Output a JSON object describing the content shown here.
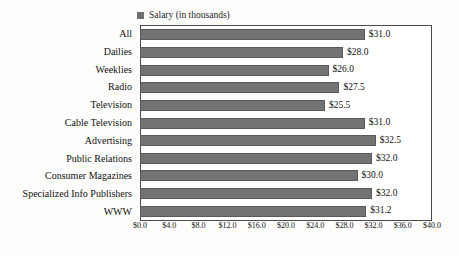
{
  "legend": {
    "marker": "filled-square",
    "label": "Salary (in thousands)",
    "marker_color": "#6f6f6f"
  },
  "axis": {
    "x_ticks": [
      "$0.0",
      "$4.0",
      "$8.0",
      "$12.0",
      "$16.0",
      "$20.0",
      "$24.0",
      "$28.0",
      "$32.0",
      "$36.0",
      "$40.0"
    ]
  },
  "style": {
    "bar_color": "#737373",
    "bar_edge_color": "#5a5a5a",
    "frame_color": "#4a4a4a",
    "background": "#fdfdfc",
    "text_color": "#111111"
  },
  "chart_data": {
    "type": "bar",
    "orientation": "horizontal",
    "title": "",
    "subtitle": "",
    "xlabel": "",
    "ylabel": "",
    "xlim": [
      0,
      40
    ],
    "xtick_step": 4,
    "grid": false,
    "legend_position": "above-plot-left",
    "series_name": "Salary (in thousands)",
    "categories": [
      "All",
      "Dailies",
      "Weeklies",
      "Radio",
      "Television",
      "Cable Television",
      "Advertising",
      "Public Relations",
      "Consumer Magazines",
      "Specialized Info Publishers",
      "WWW"
    ],
    "values": [
      31.0,
      28.0,
      26.0,
      27.5,
      25.5,
      31.0,
      32.5,
      32.0,
      30.0,
      32.0,
      31.2
    ],
    "value_labels": [
      "$31.0",
      "$28.0",
      "$26.0",
      "$27.5",
      "$25.5",
      "$31.0",
      "$32.5",
      "$32.0",
      "$30.0",
      "$32.0",
      "$31.2"
    ]
  }
}
